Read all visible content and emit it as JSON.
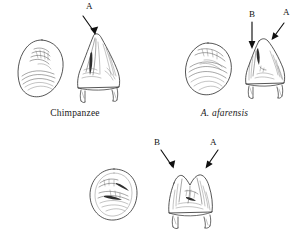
{
  "figure": {
    "type": "scientific-line-illustration",
    "background_color": "#ffffff",
    "ink_color": "#2b2b2b",
    "label_color": "#111111"
  },
  "specimens": [
    {
      "id": "chimpanzee",
      "caption": "Chimpanzee",
      "caption_style": "roman",
      "position": "top-left",
      "views": [
        {
          "view": "occlusal",
          "outline_shape": "ovoid-teardrop",
          "cusp_count": 1
        },
        {
          "view": "buccal",
          "outline_shape": "tall-conical-single-apex",
          "cusp_count": 1
        }
      ],
      "arrows": [
        {
          "label": "A",
          "target": "apex-cusp",
          "direction": "down-right"
        }
      ]
    },
    {
      "id": "a-afarensis",
      "caption": "A. afarensis",
      "caption_style": "italic",
      "position": "top-right",
      "views": [
        {
          "view": "occlusal",
          "outline_shape": "rounded-ovoid",
          "cusp_count": 2
        },
        {
          "view": "buccal",
          "outline_shape": "conical-with-shoulder",
          "cusp_count": 2
        }
      ],
      "arrows": [
        {
          "label": "B",
          "target": "mesial-shoulder",
          "direction": "down"
        },
        {
          "label": "A",
          "target": "main-apex",
          "direction": "down-left"
        }
      ]
    },
    {
      "id": "bottom-specimen",
      "caption": "",
      "caption_style": "roman",
      "position": "bottom-center",
      "views": [
        {
          "view": "occlusal",
          "outline_shape": "circular",
          "cusp_count": 2
        },
        {
          "view": "buccal",
          "outline_shape": "low-bicuspid-crown",
          "cusp_count": 2
        }
      ],
      "arrows": [
        {
          "label": "B",
          "target": "left-cusp",
          "direction": "down-right"
        },
        {
          "label": "A",
          "target": "right-cusp",
          "direction": "down-left"
        }
      ]
    }
  ],
  "labels": {
    "cusp_a": "A",
    "cusp_b": "B"
  }
}
